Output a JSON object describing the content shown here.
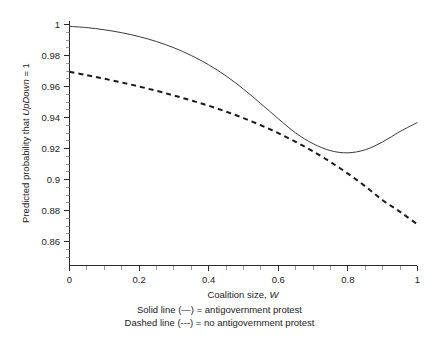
{
  "chart_data": {
    "type": "line",
    "title": "",
    "xlabel": "Coalition size, W",
    "xlabel_plain": "Coalition size,",
    "xlabel_italic": "W",
    "ylabel_plain_1": "Predicted probability that ",
    "ylabel_italic": "UpDown",
    "ylabel_plain_2": " = 1",
    "ylabel": "Predicted probability that UpDown = 1",
    "xlim": [
      0,
      1
    ],
    "ylim": [
      0.8496,
      1.0016
    ],
    "grid": false,
    "legend_position": "below-axes",
    "xticks": [
      0,
      0.2,
      0.4,
      0.6,
      0.8,
      1
    ],
    "xticklabels": [
      "0",
      "0.2",
      "0.4",
      "0.6",
      "0.8",
      "1"
    ],
    "xminor_step": 0.05,
    "yticks": [
      0.86,
      0.88,
      0.9,
      0.92,
      0.94,
      0.96,
      0.98,
      1
    ],
    "yticklabels": [
      "0.86",
      "0.88",
      "0.9",
      "0.92",
      "0.94",
      "0.96",
      "0.98",
      "1"
    ],
    "yminor_step": 0.005,
    "x": [
      0,
      0.05,
      0.1,
      0.15,
      0.2,
      0.25,
      0.3,
      0.35,
      0.4,
      0.45,
      0.5,
      0.55,
      0.6,
      0.65,
      0.7,
      0.75,
      0.8,
      0.85,
      0.9,
      0.95,
      1
    ],
    "series": [
      {
        "name": "antigovernment protest",
        "style": "solid",
        "color": "#3a3a3a",
        "values": [
          0.9988,
          0.998,
          0.9966,
          0.9947,
          0.9922,
          0.989,
          0.985,
          0.98,
          0.974,
          0.9668,
          0.9583,
          0.9489,
          0.9392,
          0.93,
          0.9231,
          0.9186,
          0.9172,
          0.9192,
          0.9243,
          0.931,
          0.9368
        ]
      },
      {
        "name": "no antigovernment protest",
        "style": "dashed",
        "color": "#1a1a1a",
        "values": [
          0.9695,
          0.9673,
          0.965,
          0.9626,
          0.96,
          0.9572,
          0.9542,
          0.951,
          0.9476,
          0.9438,
          0.9396,
          0.935,
          0.9299,
          0.9243,
          0.9181,
          0.9113,
          0.9038,
          0.8956,
          0.8866,
          0.8791,
          0.871
        ]
      }
    ],
    "legend": [
      "Solid line (—) = antigovernment protest",
      "Dashed line (---) = no antigovernment protest"
    ]
  },
  "legend_text": {
    "solid": "Solid line (—) = antigovernment protest",
    "dashed": "Dashed line (---) = no antigovernment protest"
  },
  "axes": {
    "x_title_plain": "Coalition size,",
    "x_title_italic": "W",
    "y_title_plain_1": "Predicted probability that ",
    "y_title_italic": "UpDown",
    "y_title_plain_2": " = 1"
  }
}
